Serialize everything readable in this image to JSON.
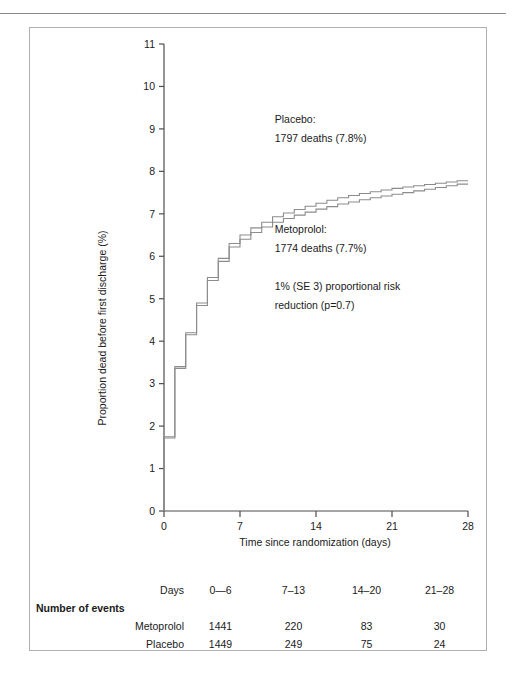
{
  "figure": {
    "separator": "horizontal-rule"
  },
  "chart_data": {
    "type": "line",
    "subtype": "kaplan-meier-step",
    "title": "",
    "xlabel": "Time since randomization (days)",
    "ylabel": "Proportion dead before first discharge (%)",
    "xlim": [
      0,
      28
    ],
    "ylim": [
      0,
      11
    ],
    "xticks": [
      0,
      7,
      14,
      21,
      28
    ],
    "yticks": [
      0,
      1,
      2,
      3,
      4,
      5,
      6,
      7,
      8,
      9,
      10,
      11
    ],
    "xtick_labels": [
      "0",
      "7",
      "14",
      "21",
      "28"
    ],
    "ytick_labels": [
      "0",
      "1",
      "2",
      "3",
      "4",
      "5",
      "6",
      "7",
      "8",
      "9",
      "10",
      "11"
    ],
    "grid": false,
    "legend": "inline-annotation",
    "x": [
      0,
      1,
      2,
      3,
      4,
      5,
      6,
      7,
      8,
      9,
      10,
      11,
      12,
      13,
      14,
      15,
      16,
      17,
      18,
      19,
      20,
      21,
      22,
      23,
      24,
      25,
      26,
      27,
      28
    ],
    "series": [
      {
        "name": "Placebo",
        "color": "#8c8c8c",
        "values": [
          0,
          1.75,
          3.4,
          4.2,
          4.9,
          5.5,
          5.95,
          6.3,
          6.5,
          6.67,
          6.8,
          6.93,
          7.02,
          7.1,
          7.18,
          7.25,
          7.32,
          7.38,
          7.43,
          7.48,
          7.52,
          7.56,
          7.6,
          7.63,
          7.66,
          7.69,
          7.72,
          7.75,
          7.78
        ]
      },
      {
        "name": "Metoprolol",
        "color": "#8c8c8c",
        "values": [
          0,
          1.72,
          3.36,
          4.15,
          4.84,
          5.43,
          5.88,
          6.22,
          6.4,
          6.56,
          6.69,
          6.8,
          6.89,
          6.97,
          7.04,
          7.11,
          7.17,
          7.23,
          7.28,
          7.33,
          7.38,
          7.42,
          7.46,
          7.5,
          7.54,
          7.58,
          7.62,
          7.66,
          7.7
        ]
      }
    ],
    "annotations": [
      {
        "name": "placebo-annotation",
        "lines": [
          "Placebo:",
          "1797 deaths (7.8%)"
        ],
        "x": 10.2,
        "y": 9.15
      },
      {
        "name": "metoprolol-annotation",
        "lines": [
          "Metoprolol:",
          "1774 deaths (7.7%)"
        ],
        "x": 10.2,
        "y": 6.55
      },
      {
        "name": "risk-reduction-annotation",
        "lines": [
          "1% (SE 3) proportional risk",
          "reduction (p=0.7)"
        ],
        "x": 10.2,
        "y": 5.2
      }
    ]
  },
  "events_table": {
    "header_label": "Days",
    "section_label": "Number of events",
    "columns": [
      "0—6",
      "7–13",
      "14–20",
      "21–28"
    ],
    "rows": [
      {
        "label": "Metoprolol",
        "values": [
          "1441",
          "220",
          "83",
          "30"
        ]
      },
      {
        "label": "Placebo",
        "values": [
          "1449",
          "249",
          "75",
          "24"
        ]
      }
    ]
  }
}
